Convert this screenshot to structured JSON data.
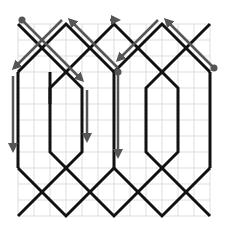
{
  "diagram": {
    "type": "knot-pattern-with-path-arrows",
    "canvas": {
      "width": 228,
      "height": 234,
      "background": "#ffffff"
    },
    "grid": {
      "x0": 18,
      "y0": 24,
      "x1": 210,
      "y1": 216,
      "step": 16,
      "color": "#dddddd"
    },
    "colors": {
      "knot": "#111111",
      "arrow": "#555555",
      "dot": "#555555"
    },
    "knot_paths": [
      "M18,24 L66,72 L66,72",
      "M18,72 L66,24 L114,72",
      "M66,72 L114,24 L162,72",
      "M114,72 L162,24 L210,72",
      "M162,72 L210,24",
      "M18,72 L18,168",
      "M210,72 L210,168",
      "M114,72 L114,168",
      "M50,72 L50,104",
      "M66,72 L82,88 L82,152 L66,168",
      "M66,72 L50,88 L50,152 L66,168",
      "M162,72 L178,88 L178,152 L162,168",
      "M162,72 L146,88 L146,152 L162,168",
      "M18,168 L66,216 L114,168 L162,216 L210,168",
      "M18,216 L66,168",
      "M66,168 L114,216 L162,168",
      "M162,168 L210,216"
    ],
    "arrows": [
      {
        "name": "arrow-diag-1",
        "from": [
          22,
          20
        ],
        "to": [
          82,
          80
        ],
        "start_dot": true
      },
      {
        "name": "arrow-diag-2",
        "from": [
          62,
          20
        ],
        "to": [
          14,
          68
        ],
        "start_dot": false
      },
      {
        "name": "arrow-diag-3",
        "from": [
          118,
          68
        ],
        "to": [
          70,
          20
        ],
        "start_dot": false
      },
      {
        "name": "arrow-diag-4",
        "from": [
          110,
          20
        ],
        "to": [
          118,
          20
        ],
        "start_dot": false
      },
      {
        "name": "arrow-diag-5",
        "from": [
          214,
          68
        ],
        "to": [
          166,
          20
        ],
        "start_dot": true
      },
      {
        "name": "arrow-diag-6",
        "from": [
          158,
          20
        ],
        "to": [
          118,
          60
        ],
        "start_dot": false
      },
      {
        "name": "arrow-vert-1",
        "from": [
          13,
          76
        ],
        "to": [
          13,
          150
        ],
        "start_dot": false
      },
      {
        "name": "arrow-vert-2",
        "from": [
          87,
          90
        ],
        "to": [
          87,
          140
        ],
        "start_dot": false
      },
      {
        "name": "arrow-vert-3",
        "from": [
          118,
          72
        ],
        "to": [
          118,
          156
        ],
        "start_dot": true
      }
    ]
  }
}
